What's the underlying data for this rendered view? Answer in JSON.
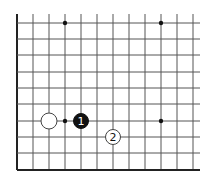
{
  "diagram": {
    "type": "go-board-fragment",
    "grid": {
      "columns_x": [
        17,
        33,
        49,
        65,
        81,
        97,
        113,
        129,
        145,
        161,
        177,
        193
      ],
      "rows_y": [
        23,
        39,
        55,
        72,
        88,
        104,
        121,
        137,
        153,
        170
      ],
      "right_extent": 200,
      "top_extent": 14,
      "left_edge_x": 17,
      "bottom_edge_y": 170,
      "line_color": "#555555",
      "edge_color": "#222222"
    },
    "hoshi": [
      {
        "x": 65,
        "y": 23
      },
      {
        "x": 161,
        "y": 23
      },
      {
        "x": 161,
        "y": 121
      },
      {
        "x": 65,
        "y": 121
      }
    ],
    "stones": [
      {
        "color": "white",
        "x": 49,
        "y": 121,
        "label": ""
      },
      {
        "color": "black",
        "x": 81,
        "y": 121,
        "label": "1"
      },
      {
        "color": "white",
        "x": 113,
        "y": 137,
        "label": "2"
      }
    ]
  }
}
